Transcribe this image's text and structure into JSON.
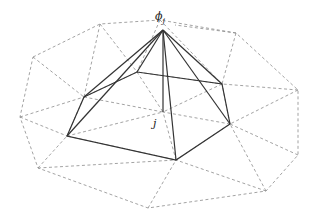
{
  "diagram": {
    "title": "",
    "labels": {
      "apex": "ϕj",
      "apex_base": "ϕ",
      "apex_sub": "j",
      "node": "j"
    },
    "colors": {
      "mesh": "#8c8c8c",
      "pyramid": "#333333",
      "background": "#ffffff"
    }
  }
}
